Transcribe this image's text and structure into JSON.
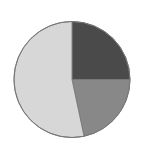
{
  "canvas": {
    "width": 145,
    "height": 154,
    "background": "#ffffff"
  },
  "chart_data": {
    "type": "pie",
    "title": "",
    "subtitle": "",
    "xlabel": "",
    "ylabel": "",
    "legend": {
      "visible": false,
      "position": "none",
      "entries": []
    },
    "grid": false,
    "annotations": [],
    "data_labels_visible": false,
    "start_angle_deg": 0,
    "direction": "clockwise",
    "geometry": {
      "center_x": 72,
      "center_y": 79.5,
      "radius": 58,
      "outline_color": "#777777",
      "outline_width": 1
    },
    "categories": [
      "Slice 1",
      "Slice 2",
      "Slice 3"
    ],
    "values": [
      25.0,
      21.7,
      53.3
    ],
    "colors": [
      "#4a4a4a",
      "#888888",
      "#d7d7d7"
    ],
    "slices": [
      {
        "label": "Slice 1",
        "value": 25.0,
        "percent": "25.0%",
        "color": "#4a4a4a",
        "start_angle_deg": 0,
        "end_angle_deg": 90
      },
      {
        "label": "Slice 2",
        "value": 21.7,
        "percent": "21.7%",
        "color": "#888888",
        "start_angle_deg": 90,
        "end_angle_deg": 168
      },
      {
        "label": "Slice 3",
        "value": 53.3,
        "percent": "53.3%",
        "color": "#d7d7d7",
        "start_angle_deg": 168,
        "end_angle_deg": 360
      }
    ]
  }
}
